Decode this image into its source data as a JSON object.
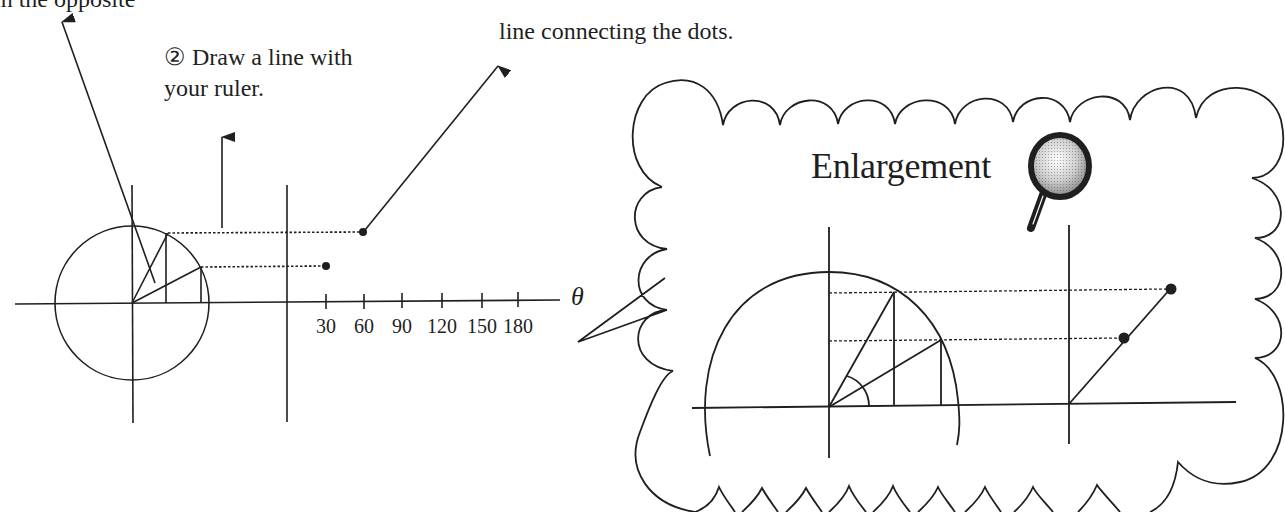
{
  "texts": {
    "top_left_cut": "in the opposite",
    "top_right": "line connecting the dots.",
    "step2_line1": "② Draw a line with",
    "step2_line2": "your ruler.",
    "enlargement_title": "Enlargement",
    "theta_label": "θ"
  },
  "axis": {
    "ticks": [
      {
        "label": "30",
        "x": 326
      },
      {
        "label": "60",
        "x": 364
      },
      {
        "label": "90",
        "x": 402
      },
      {
        "label": "120",
        "x": 442
      },
      {
        "label": "150",
        "x": 482
      },
      {
        "label": "180",
        "x": 518
      }
    ]
  },
  "left_diagram": {
    "circle": {
      "cx": 132,
      "cy": 303,
      "r": 77
    },
    "angles_deg": [
      30,
      60
    ],
    "plotted_points": [
      {
        "theta": 30,
        "x": 326,
        "y": 266
      },
      {
        "theta": 60,
        "x": 364,
        "y": 232
      }
    ]
  },
  "enlargement": {
    "plotted_points": [
      {
        "x": 1124,
        "y": 338
      },
      {
        "x": 1170,
        "y": 289
      }
    ]
  },
  "icons": {
    "magnifier": "magnifying-glass-icon"
  },
  "colors": {
    "stroke": "#1f1f1f",
    "background": "#ffffff"
  }
}
